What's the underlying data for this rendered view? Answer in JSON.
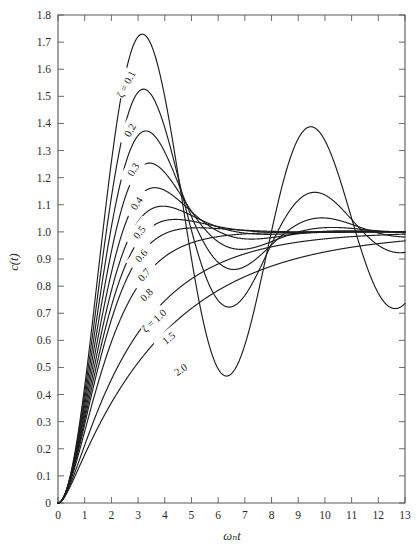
{
  "chart_data": {
    "type": "line",
    "title": "",
    "subtitle": "",
    "xlabel": "ωₙt",
    "ylabel": "c(t)",
    "xlim": [
      0,
      13
    ],
    "ylim": [
      0,
      1.8
    ],
    "grid": false,
    "legend_position": "inline-curve-labels",
    "x_ticks": [
      0,
      1,
      2,
      3,
      4,
      5,
      6,
      7,
      8,
      9,
      10,
      11,
      12,
      13
    ],
    "x_tick_labels": [
      "0",
      "1",
      "2",
      "3",
      "4",
      "5",
      "6",
      "7",
      "8",
      "9",
      "10",
      "11",
      "12",
      "13"
    ],
    "y_ticks": [
      0,
      0.1,
      0.2,
      0.3,
      0.4,
      0.5,
      0.6,
      0.7,
      0.8,
      0.9,
      1.0,
      1.1,
      1.2,
      1.3,
      1.4,
      1.5,
      1.6,
      1.7,
      1.8
    ],
    "y_tick_labels": [
      "0",
      "0.1",
      "0.2",
      "0.3",
      "0.4",
      "0.5",
      "0.6",
      "0.7",
      "0.8",
      "0.9",
      "1.0",
      "1.1",
      "1.2",
      "1.3",
      "1.4",
      "1.5",
      "1.6",
      "1.7",
      "1.8"
    ],
    "function": "unit-step-response-second-order",
    "formula": "c(t) = 1 - exp(-zeta*wn*t)/sqrt(1-zeta^2) * sin(wn*sqrt(1-zeta^2)*t + acos(zeta))",
    "series": [
      {
        "name": "ζ = 0.1",
        "zeta": 0.1,
        "label": "ζ = 0.1",
        "label_x": 2.55,
        "label_y": 1.545,
        "label_rotation": -62,
        "peak_x": 3.16,
        "peak_y": 1.729,
        "trough_x": 6.37,
        "trough_y": 0.525
      },
      {
        "name": "0.2",
        "zeta": 0.2,
        "label": "0.2",
        "label_x": 2.7,
        "label_y": 1.375,
        "label_rotation": -60,
        "peak_x": 3.21,
        "peak_y": 1.527,
        "trough_x": 6.5,
        "trough_y": 0.725
      },
      {
        "name": "0.3",
        "zeta": 0.3,
        "label": "0.3",
        "label_x": 2.82,
        "label_y": 1.23,
        "label_rotation": -58,
        "peak_x": 3.29,
        "peak_y": 1.372,
        "trough_x": 6.66,
        "trough_y": 0.847
      },
      {
        "name": "0.4",
        "zeta": 0.4,
        "label": "0.4",
        "label_x": 2.95,
        "label_y": 1.105,
        "label_rotation": -55,
        "peak_x": 3.43,
        "peak_y": 1.254,
        "trough_x": 6.89,
        "trough_y": 0.92
      },
      {
        "name": "0.5",
        "zeta": 0.5,
        "label": "0.5",
        "label_x": 3.05,
        "label_y": 0.998,
        "label_rotation": -52,
        "peak_x": 3.63,
        "peak_y": 1.163,
        "trough_x": 7.26,
        "trough_y": 0.958
      },
      {
        "name": "0.6",
        "zeta": 0.6,
        "label": "0.6",
        "label_x": 3.12,
        "label_y": 0.912,
        "label_rotation": -50,
        "peak_x": 3.93,
        "peak_y": 1.095,
        "trough_x": 7.78,
        "trough_y": 0.979
      },
      {
        "name": "0.7",
        "zeta": 0.7,
        "label": "0.7",
        "label_x": 3.22,
        "label_y": 0.842,
        "label_rotation": -48,
        "peak_x": 4.4,
        "peak_y": 1.046,
        "trough_x": 8.8,
        "trough_y": 0.991
      },
      {
        "name": "0.8",
        "zeta": 0.8,
        "label": "0.8",
        "label_x": 3.32,
        "label_y": 0.768,
        "label_rotation": -46,
        "peak_x": 5.24,
        "peak_y": 1.015,
        "trough_x": 10.5,
        "trough_y": 0.998
      },
      {
        "name": "ζ = 1.0",
        "zeta": 1.0,
        "label": "ζ = 1.0",
        "label_x": 3.6,
        "label_y": 0.672,
        "label_rotation": -42,
        "peak_x": null,
        "peak_y": null,
        "trough_x": null,
        "trough_y": null
      },
      {
        "name": "1.5",
        "zeta": 1.5,
        "label": "1.5",
        "label_x": 4.15,
        "label_y": 0.608,
        "label_rotation": -38,
        "peak_x": null,
        "peak_y": null,
        "trough_x": null,
        "trough_y": null
      },
      {
        "name": "2.0",
        "zeta": 2.0,
        "label": "2.0",
        "label_x": 4.6,
        "label_y": 0.492,
        "label_rotation": -34,
        "peak_x": null,
        "peak_y": null,
        "trough_x": null,
        "trough_y": null
      }
    ],
    "notes": {
      "steady_state": 1.0,
      "damping_ratio_symbol": "ζ",
      "natural_frequency_symbol": "ωₙ"
    }
  },
  "axes": {
    "x_title": "ωₙt",
    "y_title": "c(t)"
  },
  "colors": {
    "background": "#ffffff",
    "curve": "#1d1d1d",
    "frame": "#5a5a5a",
    "text": "#2b2b2b"
  }
}
